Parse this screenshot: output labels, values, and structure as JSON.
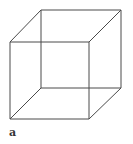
{
  "figure": {
    "label": "a",
    "line_color": "#4a4a4a",
    "vertices": {
      "front_top_left": [
        10,
        42
      ],
      "front_top_right": [
        89,
        42
      ],
      "front_bottom_right": [
        89,
        119
      ],
      "front_bottom_left": [
        10,
        119
      ],
      "back_top_left": [
        41,
        10
      ],
      "back_top_right": [
        121,
        10
      ],
      "back_bottom_right": [
        121,
        88
      ],
      "back_bottom_left": [
        41,
        88
      ]
    }
  }
}
